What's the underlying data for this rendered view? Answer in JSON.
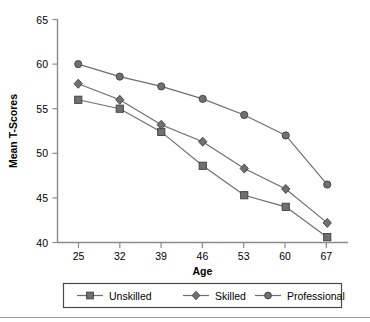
{
  "chart_data": {
    "type": "line",
    "title": "",
    "xlabel": "Age",
    "ylabel": "Mean T-Scores",
    "x": [
      25,
      32,
      39,
      46,
      53,
      60,
      67
    ],
    "xticklabels": [
      "25",
      "32",
      "39",
      "46",
      "53",
      "60",
      "67"
    ],
    "yticks": [
      40,
      45,
      50,
      55,
      60,
      65
    ],
    "yticklabels": [
      "40",
      "45",
      "50",
      "55",
      "60",
      "65"
    ],
    "ylim": [
      40,
      65
    ],
    "xlim": [
      21.5,
      70.5
    ],
    "grid": false,
    "legend_position": "below-bottom-center",
    "series": [
      {
        "name": "Unskilled",
        "marker": "square",
        "color": "#6e6e6e",
        "values": [
          56.0,
          55.0,
          52.4,
          48.6,
          45.3,
          44.0,
          40.6
        ]
      },
      {
        "name": "Skilled",
        "marker": "diamond",
        "color": "#6e6e6e",
        "values": [
          57.8,
          56.0,
          53.2,
          51.3,
          48.3,
          46.0,
          42.2
        ]
      },
      {
        "name": "Professional",
        "marker": "circle",
        "color": "#6e6e6e",
        "values": [
          60.0,
          58.6,
          57.5,
          56.1,
          54.3,
          52.0,
          46.5
        ]
      }
    ]
  },
  "legend": {
    "items": [
      {
        "label": "Unskilled",
        "marker": "square"
      },
      {
        "label": "Skilled",
        "marker": "diamond"
      },
      {
        "label": "Professional",
        "marker": "circle"
      }
    ]
  },
  "axes": {
    "x_title": "Age",
    "y_title": "Mean T-Scores"
  },
  "colors": {
    "line": "#6e6e6e",
    "marker_fill": "#707070",
    "marker_stroke": "#3f3f3f",
    "axis": "#8a8a8a",
    "text": "#000000",
    "legend_border": "#4a4a4a",
    "rule": "#9a9a9a",
    "background": "#ffffff"
  }
}
